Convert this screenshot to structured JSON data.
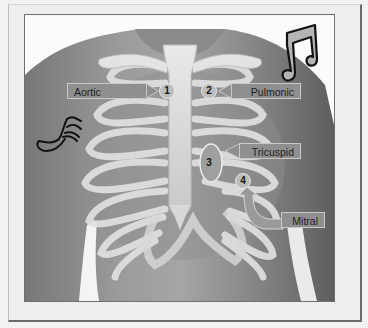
{
  "figure": {
    "colors": {
      "background": "#f2f2f2",
      "frame_border": "#6a6a6a",
      "skin_dark": "#6e6e6e",
      "skin_light": "#a9a9a9",
      "bone": "#dcdcdc",
      "label_fill": "#8f8f8f",
      "label_text": "#1e1e1e",
      "note_outline": "#111111"
    },
    "decorations": [
      {
        "name": "music-note-double",
        "position": "upper-right shoulder"
      },
      {
        "name": "music-note-sixteenth",
        "position": "left upper arm"
      }
    ],
    "points": [
      {
        "number": "1",
        "label": "Aortic",
        "side": "left-label-pointing-right"
      },
      {
        "number": "2",
        "label": "Pulmonic",
        "side": "right-label-pointing-left"
      },
      {
        "number": "3",
        "label": "Tricuspid",
        "side": "right-label-pointing-left"
      },
      {
        "number": "4",
        "label": "Mitral",
        "side": "right-label-curved-arrow-up"
      }
    ]
  }
}
